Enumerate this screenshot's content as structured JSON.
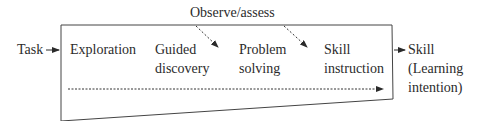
{
  "diagram": {
    "top_label": "Observe/assess",
    "input_label": "Task",
    "output_label": [
      "Skill",
      "(Learning",
      "intention)"
    ],
    "stages": [
      {
        "lines": [
          "Exploration"
        ]
      },
      {
        "lines": [
          "Guided",
          "discovery"
        ]
      },
      {
        "lines": [
          "Problem",
          "solving"
        ]
      },
      {
        "lines": [
          "Skill",
          "instruction"
        ]
      }
    ],
    "colors": {
      "line": "#3a3a3a",
      "text": "#2b2b2b"
    }
  }
}
